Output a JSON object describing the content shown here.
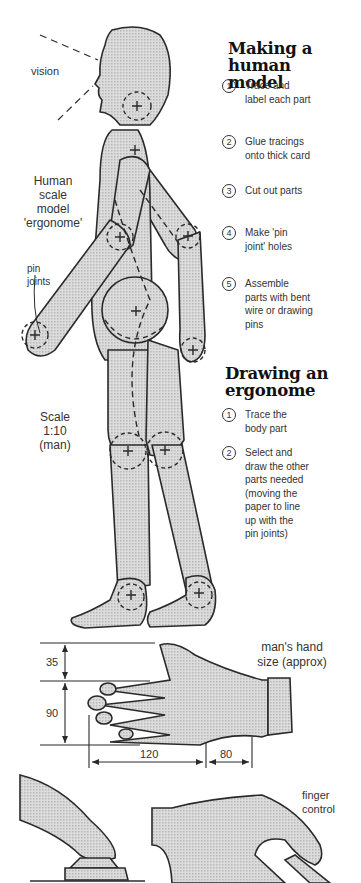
{
  "figure": {
    "vision_label": "vision",
    "model_label": "Human\nscale\nmodel\n'ergonome'",
    "pin_label": "pin\njoints",
    "scale_label": "Scale\n1:10\n(man)"
  },
  "making": {
    "title": "Making a human\nmodel",
    "steps": [
      {
        "num": "1",
        "text": "Trace and\nlabel each part"
      },
      {
        "num": "2",
        "text": "Glue tracings\nonto thick card"
      },
      {
        "num": "3",
        "text": "Cut out parts"
      },
      {
        "num": "4",
        "text": "Make 'pin\njoint' holes"
      },
      {
        "num": "5",
        "text": "Assemble\nparts with bent\nwire or drawing\npins"
      }
    ]
  },
  "drawing": {
    "title": "Drawing an\nergonome",
    "steps": [
      {
        "num": "1",
        "text": "Trace the\nbody part"
      },
      {
        "num": "2",
        "text": "Select and\ndraw the other\nparts needed\n(moving the\npaper to line\nup with the\npin joints)"
      }
    ]
  },
  "hand": {
    "caption": "man's hand\nsize (approx)",
    "dimensions": {
      "thumb_height": "35",
      "fingers_height": "90",
      "fingers_length": "120",
      "palm_length": "80"
    },
    "finger_control_label": "finger\ncontrol"
  },
  "colors": {
    "outline": "#2a2a2a",
    "fill": "#d4d4d4",
    "background": "#ffffff"
  }
}
